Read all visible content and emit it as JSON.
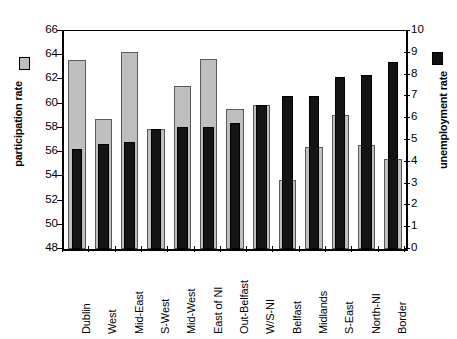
{
  "chart_data": {
    "type": "bar",
    "title": "",
    "subtitle": "",
    "xlabel": "",
    "ylabel": "participation rate",
    "y2label": "unemployment rate",
    "ylim": [
      48,
      66
    ],
    "y2lim": [
      0,
      10
    ],
    "yticks": [
      48,
      50,
      52,
      54,
      56,
      58,
      60,
      62,
      64,
      66
    ],
    "y2ticks": [
      0,
      1,
      2,
      3,
      4,
      5,
      6,
      7,
      8,
      9,
      10
    ],
    "grid": false,
    "legend_position": "axis-titles",
    "categories": [
      "Dublin",
      "West",
      "Mid-East",
      "S-West",
      "Mid-West",
      "East of NI",
      "Out-Belfast",
      "W/S-NI",
      "Belfast",
      "Midlands",
      "S-East",
      "North-NI",
      "Border"
    ],
    "series": [
      {
        "name": "participation rate",
        "axis": "left",
        "color": "#bfbfbf",
        "values": [
          63.6,
          58.7,
          64.3,
          57.9,
          61.5,
          63.7,
          59.6,
          59.9,
          53.7,
          56.4,
          59.1,
          56.6,
          55.4
        ]
      },
      {
        "name": "unemployment rate",
        "axis": "right",
        "color": "#141414",
        "values": [
          4.6,
          4.8,
          4.9,
          5.5,
          5.6,
          5.6,
          5.8,
          6.6,
          7.0,
          7.0,
          7.9,
          8.0,
          8.6
        ]
      }
    ]
  },
  "legend": {
    "participation_swatch": "grey-square-swatch",
    "unemployment_swatch": "black-square-swatch"
  }
}
